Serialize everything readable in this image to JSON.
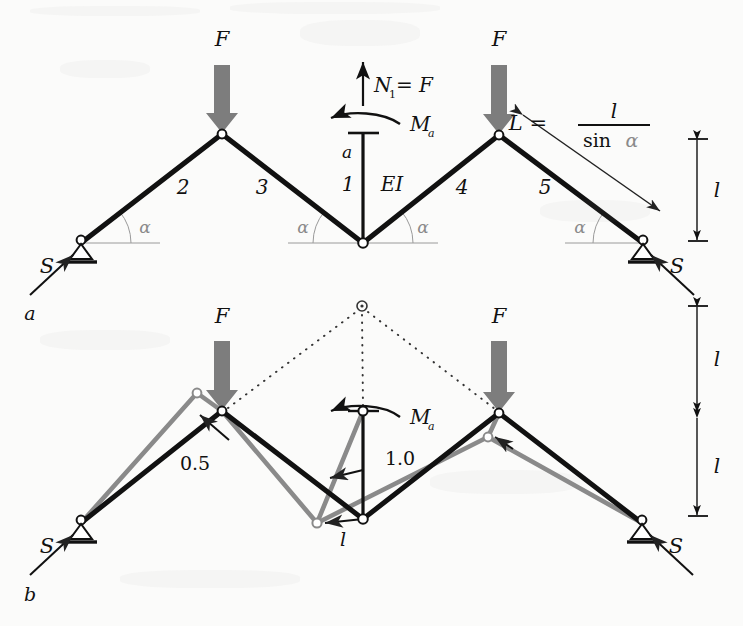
{
  "figure": {
    "panel_a_label": "a",
    "panel_b_label": "b",
    "background_color": "#fbfbfa",
    "member_color": "#111111",
    "deformed_color": "#8a8a8a",
    "load_arrow_color": "#7d7d7d",
    "thin_line_color": "#444444"
  },
  "panel_a": {
    "loads": {
      "left_force_label": "F",
      "right_force_label": "F",
      "left_support_reaction_label": "S",
      "right_support_reaction_label": "S"
    },
    "member_numbers": [
      "2",
      "3",
      "1",
      "4",
      "5"
    ],
    "member_label_2": "2",
    "member_label_3": "3",
    "member_label_1": "1",
    "member_label_4": "4",
    "member_label_5": "5",
    "stiffness_label": "EI",
    "section_label": "a",
    "normal_force_label": "N",
    "normal_force_sub": "1",
    "normal_force_rest": " = F",
    "moment_label": "M",
    "moment_sub": "a",
    "angle_labels": [
      "α",
      "α",
      "α",
      "α"
    ],
    "angle_label": "α",
    "length_formula_lhs": "L =",
    "length_formula_num": "l",
    "length_formula_den_sin": "sin",
    "length_formula_den_alpha": "α",
    "height_dimension_label": "l"
  },
  "panel_b": {
    "loads": {
      "left_force_label": "F",
      "right_force_label": "F",
      "left_support_reaction_label": "S",
      "right_support_reaction_label": "S"
    },
    "moment_label": "M",
    "moment_sub": "a",
    "displacement_label_left": "0.5",
    "displacement_label_center": "1.0",
    "length_label": "l",
    "height_dimension_top_label": "l",
    "height_dimension_bottom_label": "l"
  },
  "geometry": {
    "panel_a": {
      "left_support": [
        81,
        243
      ],
      "left_apex": [
        222,
        134
      ],
      "center_node": [
        363,
        243
      ],
      "right_apex": [
        499,
        135
      ],
      "right_support": [
        643,
        243
      ],
      "column_top": [
        363,
        133
      ],
      "dimension_x": 697,
      "dimension_top_y": 140,
      "dimension_bottom_y": 240
    },
    "panel_b": {
      "left_support": [
        81,
        523
      ],
      "left_apex": [
        222,
        411
      ],
      "center_node": [
        363,
        519
      ],
      "right_apex": [
        499,
        413
      ],
      "right_support": [
        642,
        523
      ],
      "column_top": [
        363,
        411
      ],
      "virtual_apex": [
        362,
        306
      ],
      "gray_left_apex": [
        197,
        393
      ],
      "gray_center_node": [
        317,
        523
      ],
      "gray_right_apex": [
        488,
        437
      ],
      "dimension_x": 697,
      "dimension_top_y": 307,
      "dimension_mid_y": 415,
      "dimension_bottom_y": 515
    }
  }
}
